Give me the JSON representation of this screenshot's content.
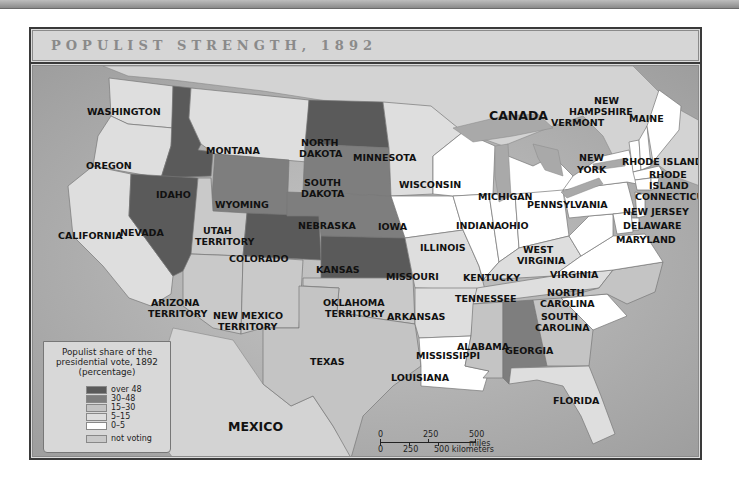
{
  "title": "POPULIST STRENGTH, 1892",
  "legend": {
    "title_lines": [
      "Populist share of the",
      "presidential vote, 1892",
      "(percentage)"
    ],
    "items": [
      {
        "label": "over 48",
        "color": "#5a5a5a"
      },
      {
        "label": "30–48",
        "color": "#7e7e7e"
      },
      {
        "label": "15–30",
        "color": "#c4c4c4"
      },
      {
        "label": "5–15",
        "color": "#dedede"
      },
      {
        "label": "0–5",
        "color": "#ffffff"
      },
      {
        "label": "not voting",
        "color": "#c9c9c9"
      }
    ]
  },
  "scale": {
    "miles_ticks": [
      "0",
      "250",
      "500 miles"
    ],
    "km_ticks": [
      "0",
      "250",
      "500 kilometers"
    ]
  },
  "colors": {
    "water": "#b5b5b5",
    "canada": "#d2d2d2",
    "lakes": "#a9a9a9"
  },
  "regions": {
    "countries": [
      "CANADA",
      "MEXICO"
    ],
    "states": [
      {
        "name": "WASHINGTON",
        "category": "5–15"
      },
      {
        "name": "OREGON",
        "category": "5–15"
      },
      {
        "name": "CALIFORNIA",
        "category": "5–15"
      },
      {
        "name": "IDAHO",
        "category": "over 48"
      },
      {
        "name": "NEVADA",
        "category": "over 48"
      },
      {
        "name": "MONTANA",
        "category": "5–15"
      },
      {
        "name": "WYOMING",
        "category": "30–48"
      },
      {
        "name": "UTAH TERRITORY",
        "category": "not voting"
      },
      {
        "name": "COLORADO",
        "category": "over 48"
      },
      {
        "name": "ARIZONA TERRITORY",
        "category": "not voting"
      },
      {
        "name": "NEW MEXICO TERRITORY",
        "category": "not voting"
      },
      {
        "name": "NORTH DAKOTA",
        "category": "over 48"
      },
      {
        "name": "SOUTH DAKOTA",
        "category": "30–48"
      },
      {
        "name": "NEBRASKA",
        "category": "30–48"
      },
      {
        "name": "KANSAS",
        "category": "over 48"
      },
      {
        "name": "OKLAHOMA TERRITORY",
        "category": "not voting"
      },
      {
        "name": "TEXAS",
        "category": "15–30"
      },
      {
        "name": "MINNESOTA",
        "category": "5–15"
      },
      {
        "name": "IOWA",
        "category": "0–5"
      },
      {
        "name": "MISSOURI",
        "category": "5–15"
      },
      {
        "name": "ARKANSAS",
        "category": "5–15"
      },
      {
        "name": "LOUISIANA",
        "category": "0–5"
      },
      {
        "name": "WISCONSIN",
        "category": "0–5"
      },
      {
        "name": "ILLINOIS",
        "category": "0–5"
      },
      {
        "name": "MICHIGAN",
        "category": "0–5"
      },
      {
        "name": "INDIANA",
        "category": "0–5"
      },
      {
        "name": "OHIO",
        "category": "0–5"
      },
      {
        "name": "KENTUCKY",
        "category": "5–15"
      },
      {
        "name": "TENNESSEE",
        "category": "5–15"
      },
      {
        "name": "MISSISSIPPI",
        "category": "15–30"
      },
      {
        "name": "ALABAMA",
        "category": "30–48"
      },
      {
        "name": "GEORGIA",
        "category": "15–30"
      },
      {
        "name": "FLORIDA",
        "category": "5–15"
      },
      {
        "name": "SOUTH CAROLINA",
        "category": "0–5"
      },
      {
        "name": "NORTH CAROLINA",
        "category": "15–30"
      },
      {
        "name": "VIRGINIA",
        "category": "0–5"
      },
      {
        "name": "WEST VIRGINIA",
        "category": "0–5"
      },
      {
        "name": "PENNSYLVANIA",
        "category": "0–5"
      },
      {
        "name": "NEW YORK",
        "category": "0–5"
      },
      {
        "name": "VERMONT",
        "category": "0–5"
      },
      {
        "name": "NEW HAMPSHIRE",
        "category": "0–5"
      },
      {
        "name": "MAINE",
        "category": "0–5"
      },
      {
        "name": "MASSACHUSETTS",
        "category": "0–5"
      },
      {
        "name": "RHODE ISLAND",
        "category": "0–5"
      },
      {
        "name": "CONNECTICUT",
        "category": "0–5"
      },
      {
        "name": "NEW JERSEY",
        "category": "0–5"
      },
      {
        "name": "DELAWARE",
        "category": "0–5"
      },
      {
        "name": "MARYLAND",
        "category": "0–5"
      }
    ]
  }
}
